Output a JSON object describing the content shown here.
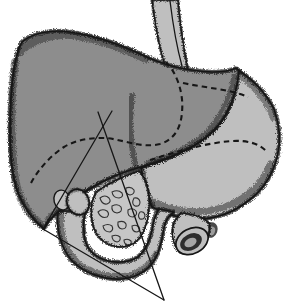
{
  "canvas": {
    "width": 291,
    "height": 307
  },
  "figure": {
    "kind": "anatomical-line-illustration",
    "parts": [
      "esophagus",
      "liver",
      "stomach",
      "gallbladder",
      "duodenum",
      "pancreas",
      "cut-vessel",
      "dissection-triangle",
      "incision-cross-mark",
      "hidden-contour-lines"
    ]
  },
  "colors": {
    "background": "#ffffff",
    "ink": "#161616",
    "liver": "#8d8d8d",
    "viscera": "#bfbfbf",
    "pancreas": "#c6c6c6",
    "lumen_dark": "#2e2e2e",
    "lumen_light": "#a5a5a5",
    "stub_dark": "#4a4a4a",
    "stub_light": "#9c9c9c"
  }
}
